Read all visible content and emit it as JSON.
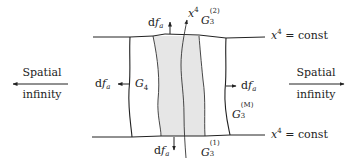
{
  "diagram": {
    "colors": {
      "stroke": "#222222",
      "shaded_region": "#e6e6e6",
      "background": "#ffffff"
    },
    "labels": {
      "spatial_infinity_left": {
        "line1": "Spatial",
        "line2": "infinity"
      },
      "spatial_infinity_right": {
        "line1": "Spatial",
        "line2": "infinity"
      },
      "top_const": {
        "var": "x",
        "sup": "4",
        "rest": " = const"
      },
      "bottom_const": {
        "var": "x",
        "sup": "4",
        "rest": " = const"
      },
      "time_axis": {
        "var": "x",
        "sup": "4"
      },
      "df_top": {
        "d": "d",
        "f": "f",
        "sub": "a"
      },
      "df_bottom": {
        "d": "d",
        "f": "f",
        "sub": "a"
      },
      "df_left": {
        "d": "d",
        "f": "f",
        "sub": "a"
      },
      "df_right": {
        "d": "d",
        "f": "f",
        "sub": "a"
      },
      "G4": {
        "base": "G",
        "sub": "4"
      },
      "G3_2": {
        "base": "G",
        "sub": "3",
        "sup": "(2)"
      },
      "G3_1": {
        "base": "G",
        "sub": "3",
        "sup": "(1)"
      },
      "G3_M": {
        "base": "G",
        "sub": "3",
        "sup": "(M)"
      }
    },
    "elements": [
      "top hypersurface x^4 = const",
      "bottom hypersurface x^4 = const",
      "left timelike boundary",
      "right timelike boundary",
      "shaded world-tube region",
      "x^4 time axis curve",
      "outward normal arrows df_a (top, bottom, left, right)",
      "arrows toward spatial infinity (left, right)"
    ]
  }
}
